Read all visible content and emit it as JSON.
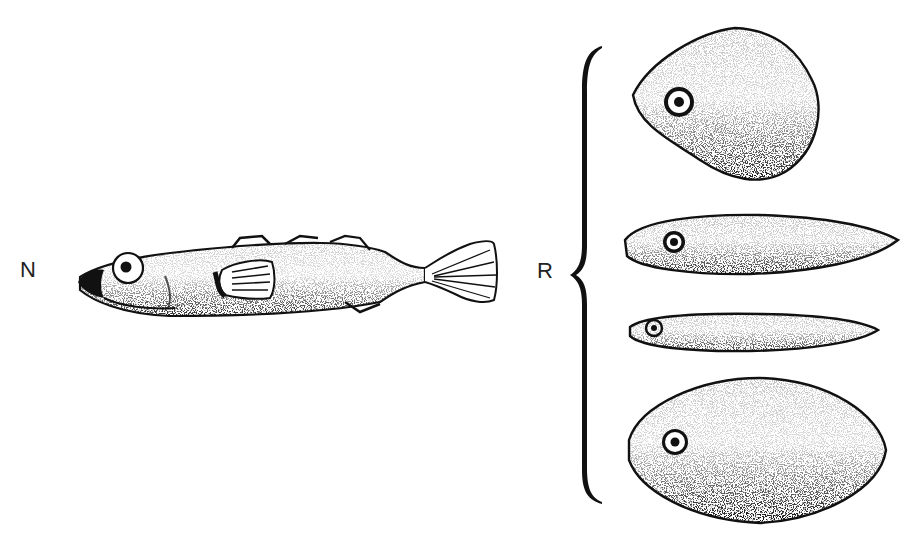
{
  "figure": {
    "left_group": {
      "label": "N",
      "description": "normal stickleback-like fish, side view"
    },
    "right_group": {
      "label": "R",
      "bracket": "curly-brace",
      "items": [
        {
          "shape": "rhomboid-blob",
          "has_eye": true
        },
        {
          "shape": "elongated-spindle",
          "has_eye": true
        },
        {
          "shape": "thin-spindle",
          "has_eye": true
        },
        {
          "shape": "oval-lens",
          "has_eye": true
        }
      ]
    },
    "colors": {
      "ink": "#111111",
      "background": "#ffffff"
    }
  }
}
